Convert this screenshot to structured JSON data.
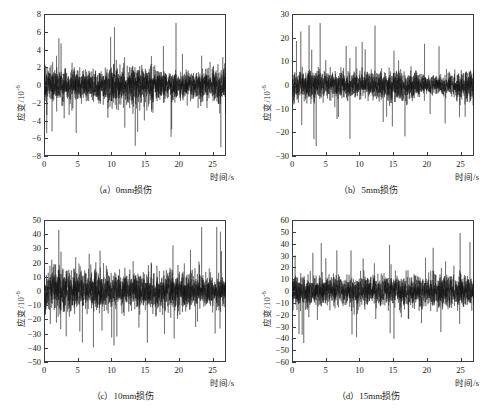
{
  "figure": {
    "background": "#ffffff",
    "trace_color": "#141414",
    "axis_color": "#3b3b3b"
  },
  "chart_data": [
    {
      "type": "line",
      "panel_id": "a",
      "title": "（a）0mm损伤",
      "xlabel": "时间/s",
      "ylabel": "应变/10",
      "ylabel_exponent": "-6",
      "xlim": [
        0,
        27
      ],
      "ylim": [
        -8,
        8
      ],
      "xticks": [
        0,
        5,
        10,
        15,
        20,
        25
      ],
      "yticks": [
        8,
        6,
        4,
        2,
        0,
        -2,
        -4,
        -6,
        -8
      ],
      "ytick_labels": [
        "8",
        "6",
        "4",
        "2",
        "0",
        "-2",
        "-4",
        "-6",
        "-8"
      ],
      "xtick_labels": [
        "0",
        "5",
        "10",
        "15",
        "20",
        "25"
      ],
      "grid": false,
      "legend": "none",
      "series": [
        {
          "name": "应变时程",
          "description": "0mm损伤工况下的随机应变时程信号",
          "noise_sigma": 1.35,
          "peak_amplitude": 7.0,
          "samples": 2400,
          "seed": 11
        }
      ]
    },
    {
      "type": "line",
      "panel_id": "b",
      "title": "（b）5mm损伤",
      "xlabel": "时间/s",
      "ylabel": "应变/10",
      "ylabel_exponent": "-6",
      "xlim": [
        0,
        27
      ],
      "ylim": [
        -30,
        30
      ],
      "xticks": [
        0,
        5,
        10,
        15,
        20,
        25
      ],
      "yticks": [
        30,
        20,
        10,
        0,
        -10,
        -20,
        -30
      ],
      "ytick_labels": [
        "30",
        "20",
        "10",
        "0",
        "-10",
        "-20",
        "-30"
      ],
      "xtick_labels": [
        "0",
        "5",
        "10",
        "15",
        "20",
        "25"
      ],
      "grid": false,
      "legend": "none",
      "series": [
        {
          "name": "应变时程",
          "description": "5mm损伤工况下的随机应变时程信号",
          "noise_sigma": 3.9,
          "peak_amplitude": 27.0,
          "samples": 2400,
          "seed": 27
        }
      ]
    },
    {
      "type": "line",
      "panel_id": "c",
      "title": "（c）10mm损伤",
      "xlabel": "时间/s",
      "ylabel": "应变/10",
      "ylabel_exponent": "-6",
      "xlim": [
        0,
        27
      ],
      "ylim": [
        -50,
        50
      ],
      "xticks": [
        0,
        5,
        10,
        15,
        20,
        25
      ],
      "yticks": [
        50,
        40,
        30,
        20,
        10,
        0,
        -10,
        -20,
        -30,
        -40,
        -50
      ],
      "ytick_labels": [
        "50",
        "40",
        "30",
        "20",
        "10",
        "0",
        "-10",
        "-20",
        "-30",
        "-40",
        "-50"
      ],
      "xtick_labels": [
        "0",
        "5",
        "10",
        "15",
        "20",
        "25"
      ],
      "grid": false,
      "legend": "none",
      "series": [
        {
          "name": "应变时程",
          "description": "10mm损伤工况下的随机应变时程信号",
          "noise_sigma": 8.2,
          "peak_amplitude": 45.0,
          "samples": 2400,
          "seed": 43
        }
      ]
    },
    {
      "type": "line",
      "panel_id": "d",
      "title": "（d）15mm损伤",
      "xlabel": "时间/s",
      "ylabel": "应变/10",
      "ylabel_exponent": "-6",
      "xlim": [
        0,
        27
      ],
      "ylim": [
        -60,
        60
      ],
      "xticks": [
        0,
        5,
        10,
        15,
        20,
        25
      ],
      "yticks": [
        60,
        50,
        40,
        30,
        20,
        10,
        0,
        -10,
        -20,
        -30,
        -40,
        -50,
        -60
      ],
      "ytick_labels": [
        "60",
        "50",
        "40",
        "30",
        "20",
        "10",
        "0",
        "-10",
        "-20",
        "-30",
        "-40",
        "-50",
        "-60"
      ],
      "xtick_labels": [
        "0",
        "5",
        "10",
        "15",
        "20",
        "25"
      ],
      "grid": false,
      "legend": "none",
      "series": [
        {
          "name": "应变时程",
          "description": "15mm损伤工况下的随机应变时程信号",
          "noise_sigma": 8.6,
          "peak_amplitude": 49.0,
          "samples": 2400,
          "seed": 59
        }
      ]
    }
  ]
}
